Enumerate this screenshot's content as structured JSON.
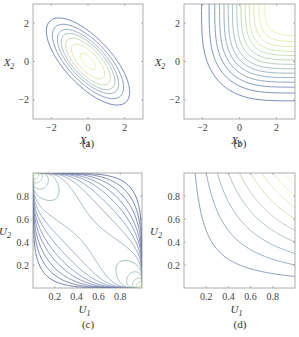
{
  "chart_data": [
    {
      "id": "a",
      "type": "contour",
      "caption": "(a)",
      "xlabel": "X",
      "xlabel_sub": "1",
      "ylabel": "X",
      "ylabel_sub": "2",
      "xlim": [
        -3,
        3
      ],
      "ylim": [
        -3,
        3
      ],
      "xticks": [
        -2,
        0,
        2
      ],
      "yticks": [
        -2,
        0,
        2
      ],
      "xtick_labels": [
        "−2",
        "0",
        "2"
      ],
      "ytick_labels": [
        "−2",
        "0",
        "2"
      ],
      "description": "Bivariate normal density contours with negative correlation (ellipses oriented along y=-x)",
      "correlation": -0.7,
      "levels": 7,
      "colormap": [
        "#4a5a9a",
        "#6a88b0",
        "#8fb0a8",
        "#c8dc9a",
        "#e8ec98"
      ]
    },
    {
      "id": "b",
      "type": "contour",
      "caption": "(b)",
      "xlabel": "X",
      "xlabel_sub": "1",
      "ylabel": "X",
      "ylabel_sub": "2",
      "xlim": [
        -3,
        3
      ],
      "ylim": [
        -3,
        3
      ],
      "xticks": [
        -2,
        0,
        2
      ],
      "yticks": [
        -2,
        0,
        2
      ],
      "xtick_labels": [
        "−2",
        "0",
        "2"
      ],
      "ytick_labels": [
        "−2",
        "0",
        "2"
      ],
      "description": "Bivariate distribution function contours, increasing toward upper-right corner",
      "levels": 14,
      "colormap": [
        "#4a5a9a",
        "#6a88b0",
        "#8fb0a8",
        "#c8dc9a",
        "#e8ec98"
      ]
    },
    {
      "id": "c",
      "type": "contour",
      "caption": "(c)",
      "xlabel": "U",
      "xlabel_sub": "1",
      "ylabel": "U",
      "ylabel_sub": "2",
      "xlim": [
        0,
        1
      ],
      "ylim": [
        0,
        1
      ],
      "xticks": [
        0.2,
        0.4,
        0.6,
        0.8
      ],
      "yticks": [
        0.2,
        0.4,
        0.6,
        0.8
      ],
      "xtick_labels": [
        "0.2",
        "0.4",
        "0.6",
        "0.8"
      ],
      "ytick_labels": [
        "0.2",
        "0.4",
        "0.6",
        "0.8"
      ],
      "description": "Gaussian copula density contours with negative correlation, peaks at corners (0,1) and (1,0)",
      "correlation": -0.7,
      "levels": 14,
      "colormap": [
        "#3a4a8a",
        "#6a7ab0",
        "#8fb0a8",
        "#c8dc9a"
      ]
    },
    {
      "id": "d",
      "type": "contour",
      "caption": "(d)",
      "xlabel": "U",
      "xlabel_sub": "1",
      "ylabel": "U",
      "ylabel_sub": "2",
      "xlim": [
        0,
        1
      ],
      "ylim": [
        0,
        1
      ],
      "xticks": [
        0.2,
        0.4,
        0.6,
        0.8
      ],
      "yticks": [
        0.2,
        0.4,
        0.6,
        0.8
      ],
      "xtick_labels": [
        "0.2",
        "0.4",
        "0.6",
        "0.8"
      ],
      "ytick_labels": [
        "0.2",
        "0.4",
        "0.6",
        "0.8"
      ],
      "description": "Copula distribution function contours, increasing toward upper-right corner",
      "levels": 9,
      "colormap": [
        "#6a7a9a",
        "#8fa8b0",
        "#c8dca0",
        "#eef0c0"
      ]
    }
  ],
  "layout": {
    "panels": [
      {
        "id": "a",
        "x": 33,
        "y": 4,
        "w": 110,
        "h": 115
      },
      {
        "id": "b",
        "x": 184,
        "y": 4,
        "w": 111,
        "h": 115
      },
      {
        "id": "c",
        "x": 33,
        "y": 173,
        "w": 109,
        "h": 115
      },
      {
        "id": "d",
        "x": 184,
        "y": 173,
        "w": 111,
        "h": 115
      }
    ]
  }
}
